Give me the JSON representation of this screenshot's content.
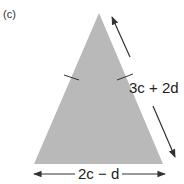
{
  "part_label": "(c)",
  "shape": {
    "type": "isosceles-triangle",
    "fill": "#b9b9b9",
    "vertices": {
      "apex": [
        99,
        13
      ],
      "bottom_left": [
        34,
        164
      ],
      "bottom_right": [
        163,
        164
      ]
    },
    "equal_side_marks": 2
  },
  "labels": {
    "side": "3c + 2d",
    "base": "2c − d"
  },
  "colors": {
    "arrow": "#333333",
    "text": "#222222",
    "tick": "#333333"
  }
}
